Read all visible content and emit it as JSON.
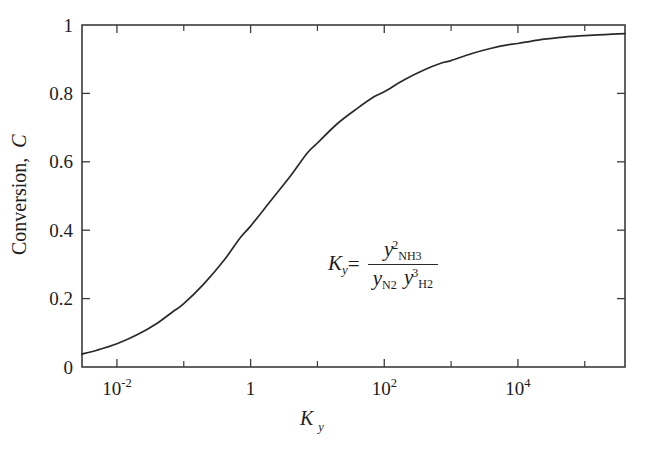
{
  "figure": {
    "background": "#ffffff",
    "line_color": "#2a2a2a",
    "axis_color": "#3b3b3b"
  },
  "axis_titles": {
    "y": "Conversion, C",
    "y_text": "Conversion,",
    "y_italic": "C",
    "x_base": "K",
    "x_sub": "y"
  },
  "formula": {
    "lhs_base": "K",
    "lhs_sub": "y",
    "equals": "=",
    "numerator": {
      "base": "y",
      "sub": "NH",
      "sub2": "3",
      "sup": "2"
    },
    "denominator_1": {
      "base": "y",
      "sub": "N",
      "sub2": "2"
    },
    "denominator_2": {
      "base": "y",
      "sub": "H",
      "sub2": "2",
      "sup": "3"
    }
  },
  "chart_data": {
    "type": "line",
    "title": "",
    "xlabel": "K_y",
    "ylabel": "Conversion, C",
    "xscale": "log",
    "yscale": "linear",
    "xlim": [
      0.003,
      400000
    ],
    "ylim": [
      0,
      1
    ],
    "grid": false,
    "legend": null,
    "x_tick_labels": [
      "10⁻²",
      "1",
      "10²",
      "10⁴"
    ],
    "x_tick_values": [
      0.01,
      1,
      100,
      10000
    ],
    "x_minor_tick_values": [
      1,
      100,
      10000
    ],
    "y_tick_labels": [
      "0",
      "0.2",
      "0.4",
      "0.6",
      "0.8",
      "1"
    ],
    "y_tick_values": [
      0,
      0.2,
      0.4,
      0.6,
      0.8,
      1
    ],
    "annotation": "K_y = y^2_NH3 / (y_N2 y^3_H2)",
    "series": [
      {
        "name": "Conversion vs Ky",
        "x": [
          0.003,
          0.005,
          0.01,
          0.02,
          0.04,
          0.07,
          0.1,
          0.2,
          0.4,
          0.7,
          1,
          2,
          4,
          7,
          10,
          20,
          40,
          70,
          100,
          200,
          400,
          700,
          1000,
          2000,
          4000,
          7000,
          10000,
          20000,
          40000,
          70000,
          100000,
          200000,
          400000
        ],
        "y": [
          0.038,
          0.049,
          0.068,
          0.094,
          0.128,
          0.163,
          0.185,
          0.243,
          0.312,
          0.378,
          0.412,
          0.486,
          0.56,
          0.625,
          0.655,
          0.712,
          0.757,
          0.79,
          0.805,
          0.84,
          0.869,
          0.888,
          0.896,
          0.916,
          0.932,
          0.942,
          0.946,
          0.956,
          0.963,
          0.967,
          0.969,
          0.972,
          0.975
        ]
      }
    ]
  },
  "geometry": {
    "plot_left": 82,
    "plot_right": 625,
    "plot_top": 25,
    "plot_bottom": 367,
    "px_per_decade": 67,
    "x_at_one": 255
  }
}
